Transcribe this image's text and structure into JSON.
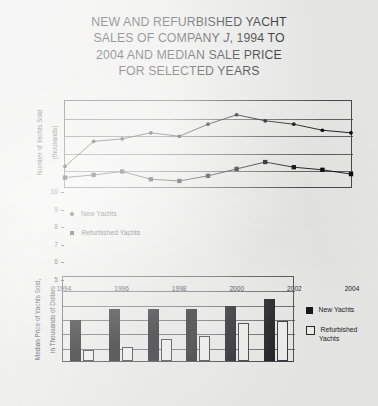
{
  "title": {
    "line1": "NEW AND REFURBISHED YACHT",
    "line2_a": "SALES OF COMPANY ",
    "line2_italic": "J",
    "line2_b": ", 1994 TO",
    "line3": "2004 AND MEDIAN SALE PRICE",
    "line4": "FOR SELECTED YEARS"
  },
  "colors": {
    "page_background": "#ececeb",
    "ink": "#16161a",
    "series_new": "#0d0d11",
    "series_refurbished_fill": "#f3f3f2",
    "series_refurbished_stroke": "#2a2a31",
    "gridline": "#4a4a4e"
  },
  "chart_data": [
    {
      "type": "line",
      "title": "",
      "xlabel": "",
      "ylabel": "Number of Yachts Sold (thousands)",
      "ylabel_line1": "Number of Yachts Sold",
      "ylabel_line2": "(thousands)",
      "x": [
        1994,
        1995,
        1996,
        1997,
        1998,
        1999,
        2000,
        2001,
        2002,
        2003,
        2004
      ],
      "xticks": [
        "1994",
        "1996",
        "1998",
        "2000",
        "2002",
        "2004"
      ],
      "xtick_values": [
        1994,
        1996,
        1998,
        2000,
        2002,
        2004
      ],
      "yticks": [
        "5",
        "6",
        "7",
        "8",
        "9",
        "10"
      ],
      "ytick_values": [
        5,
        6,
        7,
        8,
        9,
        10
      ],
      "ylim": [
        5,
        10
      ],
      "xlim": [
        1994,
        2004
      ],
      "grid": true,
      "legend_position": "below-left",
      "series": [
        {
          "name": "New Yachts",
          "marker": "circle",
          "values": [
            6.2,
            7.65,
            7.8,
            8.15,
            7.95,
            8.65,
            9.2,
            8.85,
            8.65,
            8.3,
            8.15
          ]
        },
        {
          "name": "Refurbished Yachts",
          "marker": "square",
          "values": [
            5.55,
            5.7,
            5.9,
            5.45,
            5.35,
            5.65,
            6.05,
            6.45,
            6.15,
            6.0,
            5.75
          ]
        }
      ]
    },
    {
      "type": "bar",
      "title": "",
      "xlabel": "",
      "ylabel": "Median Price of Yachts Sold, in Thousands of Dollars",
      "ylabel_line1": "Median Price of Yachts Sold,",
      "ylabel_line2": "in Thousands of Dollars",
      "categories": [
        "1994",
        "1996",
        "1998",
        "2000",
        "2002",
        "2004"
      ],
      "yticks": [
        "100",
        "125",
        "150",
        "175",
        "200",
        "225",
        "250"
      ],
      "ytick_values": [
        100,
        125,
        150,
        175,
        200,
        225,
        250
      ],
      "ylim": [
        100,
        250
      ],
      "grid": true,
      "legend_position": "right",
      "series": [
        {
          "name": "New Yachts",
          "style": "filled",
          "values": [
            172,
            190,
            191,
            191,
            196,
            208
          ]
        },
        {
          "name": "Refurbished Yachts",
          "style": "open",
          "label_line1": "Refurbished",
          "label_line2": "Yachts",
          "values": [
            120,
            124,
            138,
            143,
            166,
            170
          ]
        }
      ]
    }
  ]
}
